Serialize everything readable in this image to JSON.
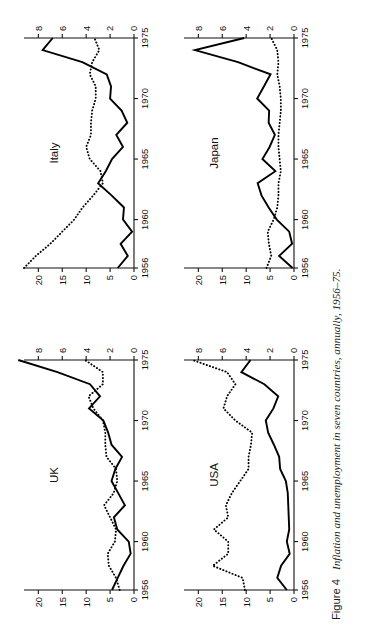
{
  "figure": {
    "caption_label": "Figure 4",
    "caption_text": "Inflation and unemployment in seven countries, annually, 1956–75.",
    "rotation_deg": -90,
    "background_color": "#ffffff",
    "ink_color": "#111111"
  },
  "axes_common": {
    "x_tick_labels": [
      "1956",
      "1960",
      "1965",
      "1970",
      "1975"
    ],
    "x_tick_years": [
      1956,
      1960,
      1965,
      1970,
      1975
    ],
    "x_range": [
      1956,
      1975
    ],
    "left_axis_tick_labels": [
      "0",
      "5",
      "10",
      "15",
      "20"
    ],
    "left_axis_ticks": [
      0,
      5,
      10,
      15,
      20
    ],
    "left_axis_range": [
      0,
      23
    ],
    "right_axis_tick_labels": [
      "0",
      "2",
      "4",
      "6",
      "8"
    ],
    "right_axis_ticks": [
      0,
      2,
      4,
      6,
      8
    ],
    "right_axis_range": [
      0,
      9.2
    ],
    "grid": false,
    "legend": "none"
  },
  "chart_data": [
    {
      "type": "line",
      "title": "UK",
      "panel_index": 0,
      "xlabel": "",
      "ylabel": "",
      "x": [
        1956,
        1957,
        1958,
        1959,
        1960,
        1961,
        1962,
        1963,
        1964,
        1965,
        1966,
        1967,
        1968,
        1969,
        1970,
        1971,
        1972,
        1973,
        1974,
        1975
      ],
      "xlim": [
        1956,
        1975
      ],
      "ylim_left": [
        0,
        23
      ],
      "ylim_right": [
        0,
        9.2
      ],
      "series": [
        {
          "name": "Inflation",
          "style": "solid",
          "axis": "left",
          "values": [
            4.6,
            3.4,
            2.2,
            0.7,
            1.1,
            3.5,
            4.2,
            1.9,
            3.3,
            4.7,
            3.9,
            2.5,
            4.7,
            5.4,
            6.4,
            9.4,
            7.1,
            9.2,
            16.0,
            24.2
          ]
        },
        {
          "name": "Unemployment",
          "style": "dotted",
          "axis": "right",
          "values": [
            1.2,
            1.5,
            2.1,
            2.2,
            1.6,
            1.5,
            2.0,
            2.5,
            1.7,
            1.4,
            1.5,
            2.3,
            2.4,
            2.4,
            2.6,
            3.4,
            3.8,
            2.6,
            2.6,
            4.1
          ]
        }
      ]
    },
    {
      "type": "line",
      "title": "Italy",
      "panel_index": 1,
      "xlabel": "",
      "ylabel": "",
      "x": [
        1956,
        1957,
        1958,
        1959,
        1960,
        1961,
        1962,
        1963,
        1964,
        1965,
        1966,
        1967,
        1968,
        1969,
        1970,
        1971,
        1972,
        1973,
        1974,
        1975
      ],
      "xlim": [
        1956,
        1975
      ],
      "ylim_left": [
        0,
        23
      ],
      "ylim_right": [
        0,
        9.2
      ],
      "series": [
        {
          "name": "Inflation",
          "style": "solid",
          "axis": "left",
          "values": [
            3.4,
            1.3,
            2.8,
            0.4,
            2.3,
            2.1,
            4.7,
            7.5,
            5.9,
            4.6,
            2.3,
            3.7,
            1.4,
            2.6,
            5.0,
            4.8,
            5.7,
            10.8,
            19.1,
            17.0
          ]
        },
        {
          "name": "Unemployment",
          "style": "dotted",
          "axis": "right",
          "values": [
            9.2,
            8.2,
            7.0,
            6.0,
            5.0,
            4.3,
            3.4,
            2.6,
            2.8,
            3.7,
            4.0,
            3.6,
            3.6,
            3.5,
            3.2,
            3.2,
            3.7,
            3.5,
            2.9,
            3.3
          ]
        }
      ]
    },
    {
      "type": "line",
      "title": "USA",
      "panel_index": 2,
      "xlabel": "",
      "ylabel": "",
      "x": [
        1956,
        1957,
        1958,
        1959,
        1960,
        1961,
        1962,
        1963,
        1964,
        1965,
        1966,
        1967,
        1968,
        1969,
        1970,
        1971,
        1972,
        1973,
        1974,
        1975
      ],
      "xlim": [
        1956,
        1975
      ],
      "ylim_left": [
        0,
        23
      ],
      "ylim_right": [
        0,
        9.2
      ],
      "series": [
        {
          "name": "Inflation",
          "style": "solid",
          "axis": "left",
          "values": [
            1.5,
            3.5,
            2.7,
            0.9,
            1.5,
            1.0,
            1.1,
            1.2,
            1.3,
            1.7,
            2.9,
            3.1,
            4.2,
            5.4,
            5.9,
            4.3,
            3.3,
            6.2,
            11.0,
            9.1
          ]
        },
        {
          "name": "Unemployment",
          "style": "dotted",
          "axis": "right",
          "values": [
            4.1,
            4.3,
            6.8,
            5.5,
            5.5,
            6.7,
            5.5,
            5.7,
            5.2,
            4.5,
            3.8,
            3.8,
            3.6,
            3.5,
            4.9,
            5.9,
            5.6,
            4.9,
            5.6,
            8.5
          ]
        }
      ]
    },
    {
      "type": "line",
      "title": "Japan",
      "panel_index": 3,
      "xlabel": "",
      "ylabel": "",
      "x": [
        1956,
        1957,
        1958,
        1959,
        1960,
        1961,
        1962,
        1963,
        1964,
        1965,
        1966,
        1967,
        1968,
        1969,
        1970,
        1971,
        1972,
        1973,
        1974,
        1975
      ],
      "xlim": [
        1956,
        1975
      ],
      "ylim_left": [
        0,
        23
      ],
      "ylim_right": [
        0,
        9.2
      ],
      "series": [
        {
          "name": "Inflation",
          "style": "solid",
          "axis": "left",
          "values": [
            0.3,
            3.1,
            0.4,
            1.0,
            3.6,
            5.3,
            6.8,
            7.6,
            3.9,
            6.6,
            5.1,
            4.0,
            5.3,
            5.2,
            7.7,
            6.3,
            4.9,
            11.7,
            20.7,
            10.4
          ]
        },
        {
          "name": "Unemployment",
          "style": "dotted",
          "axis": "right",
          "values": [
            2.3,
            1.9,
            2.1,
            2.2,
            1.7,
            1.4,
            1.3,
            1.3,
            1.1,
            1.2,
            1.3,
            1.3,
            1.2,
            1.1,
            1.1,
            1.2,
            1.4,
            1.3,
            1.4,
            1.9
          ]
        }
      ]
    }
  ]
}
